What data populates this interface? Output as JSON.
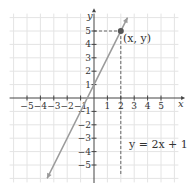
{
  "chart_data": {
    "type": "line",
    "title": "",
    "xlabel": "x",
    "ylabel": "y",
    "xlim": [
      -6,
      6
    ],
    "ylim": [
      -6,
      6
    ],
    "grid": true,
    "x_ticks": [
      -5,
      -4,
      -3,
      -2,
      -1,
      1,
      2,
      3,
      4,
      5
    ],
    "y_ticks": [
      -5,
      -4,
      -3,
      -2,
      -1,
      1,
      2,
      3,
      4,
      5
    ],
    "x_tick_labels": [
      "−5",
      "−4",
      "−3",
      "−2",
      "−1",
      "1",
      "2",
      "3",
      "4",
      "5"
    ],
    "y_tick_labels": [
      "−5",
      "−4",
      "−3",
      "−2",
      "−1",
      "1",
      "2",
      "3",
      "4",
      "5"
    ],
    "series": [
      {
        "name": "y = 2x + 1",
        "equation": "y = 2x + 1",
        "slope": 2,
        "intercept": 1,
        "x": [
          -3.5,
          2.5
        ],
        "y": [
          -6,
          6
        ],
        "color": "#9a9a9a"
      }
    ],
    "highlighted_point": {
      "x": 2,
      "y": 5,
      "label": "(x, y)",
      "color": "#555555"
    },
    "annotations": [
      {
        "text": "(x, y)",
        "x": 2.1,
        "y": 4.6
      },
      {
        "text": "y = 2x + 1",
        "x": 2.6,
        "y": -3.3
      }
    ],
    "guide_lines": [
      {
        "from": [
          0,
          5
        ],
        "to": [
          2,
          5
        ],
        "style": "dashed"
      },
      {
        "from": [
          2,
          5
        ],
        "to": [
          2,
          -6
        ],
        "style": "dashed"
      }
    ]
  },
  "labels": {
    "x_axis": "x",
    "y_axis": "y",
    "point": "(x, y)",
    "equation": "y = 2x + 1"
  },
  "colors": {
    "grid": "#e4e4e4",
    "axis": "#444444",
    "line": "#9a9a9a",
    "point": "#555555",
    "guide": "#666666"
  }
}
